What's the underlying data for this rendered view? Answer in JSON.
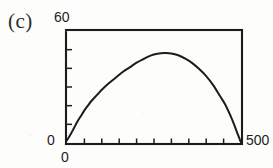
{
  "figure": {
    "panel_label": "(c)",
    "background_color": "#fdfdfc",
    "ink_color": "#1c1c1c"
  },
  "chart_data": {
    "type": "line",
    "title": "(c)",
    "xlabel": "",
    "ylabel": "",
    "xlim": [
      0,
      500
    ],
    "ylim": [
      0,
      60
    ],
    "xtick_labels": [
      "0",
      "500"
    ],
    "ytick_labels": [
      "0",
      "60"
    ],
    "x_tick_count": 10,
    "y_tick_count": 6,
    "ticks_direction": "inward",
    "grid": false,
    "legend": null,
    "frame": "box",
    "series": [
      {
        "name": "curve",
        "color": "#1c1c1c",
        "x": [
          0,
          10,
          20,
          30,
          40,
          50,
          60,
          70,
          80,
          90,
          100,
          120,
          140,
          160,
          180,
          200,
          220,
          240,
          260,
          280,
          300,
          320,
          340,
          360,
          380,
          400,
          420,
          440,
          455,
          470,
          480,
          490,
          500
        ],
        "y": [
          1.5,
          4.5,
          8.0,
          11.5,
          14.5,
          17.5,
          20.0,
          22.5,
          24.5,
          26.5,
          28.5,
          32.0,
          35.0,
          38.0,
          40.5,
          43.0,
          45.0,
          46.8,
          47.8,
          48.2,
          48.0,
          47.0,
          45.2,
          42.8,
          39.6,
          35.8,
          31.0,
          25.0,
          20.5,
          14.5,
          10.0,
          5.0,
          0.3
        ]
      }
    ]
  },
  "axis_labels": {
    "y_max": "60",
    "y_min": "0",
    "x_min": "0",
    "x_max": "500"
  }
}
